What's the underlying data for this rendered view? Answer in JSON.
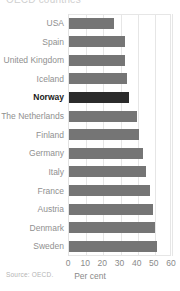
{
  "title_cropped": "OECD countries",
  "footer": {
    "source": "Source: OECD."
  },
  "axis": {
    "xlabel": "Per cent",
    "ticks": [
      "0",
      "10",
      "20",
      "30",
      "40",
      "50",
      "60"
    ]
  },
  "colors": {
    "bar": "#757575",
    "highlight_bar": "#2b2b2b",
    "grid": "#e6e6e6",
    "label": "#909090",
    "highlight_label": "#1a1a1a"
  },
  "chart_data": {
    "type": "bar",
    "orientation": "horizontal",
    "title": "",
    "xlabel": "Per cent",
    "ylabel": "",
    "xlim": [
      0,
      60
    ],
    "xticks": [
      0,
      10,
      20,
      30,
      40,
      50,
      60
    ],
    "grid": true,
    "legend": false,
    "highlight": "Norway",
    "categories": [
      "USA",
      "Spain",
      "United Kingdom",
      "Iceland",
      "Norway",
      "The Netherlands",
      "Finland",
      "Germany",
      "Italy",
      "France",
      "Austria",
      "Denmark",
      "Sweden"
    ],
    "values": [
      26,
      32.5,
      32.5,
      34,
      35,
      39.5,
      41,
      43,
      45,
      47,
      49,
      50,
      51.5
    ],
    "source": "Source: OECD."
  }
}
